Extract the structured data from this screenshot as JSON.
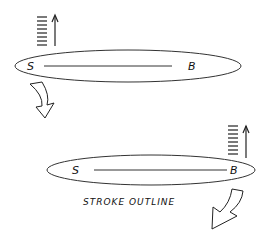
{
  "diagram": {
    "colors": {
      "stroke": "#222222",
      "background": "#ffffff"
    },
    "top_stroke": {
      "start_label": "S",
      "end_label": "B"
    },
    "bottom_stroke": {
      "start_label": "S",
      "end_label": "B"
    },
    "caption": "STROKE OUTLINE"
  }
}
